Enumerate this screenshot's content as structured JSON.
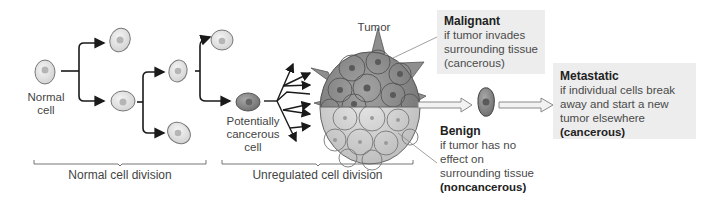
{
  "figure": {
    "labels": {
      "normal_cell": [
        "Normal",
        "cell"
      ],
      "potentially_cancerous": [
        "Potentially",
        "cancerous",
        "cell"
      ],
      "tumor": "Tumor"
    },
    "stages": [
      {
        "label": "Normal cell division"
      },
      {
        "label": "Unregulated cell division"
      }
    ],
    "outcomes": {
      "malignant": {
        "title": "Malignant",
        "lines": [
          "if tumor invades",
          "surrounding tissue",
          "(cancerous)"
        ]
      },
      "benign": {
        "title": "Benign",
        "lines": [
          "if tumor has no",
          "effect on",
          "surrounding tissue"
        ],
        "emphasis": "(noncancerous)"
      },
      "metastatic": {
        "title": "Metastatic",
        "lines": [
          "if individual cells break",
          "away and start a new",
          "tumor elsewhere"
        ],
        "emphasis": "(cancerous)"
      }
    },
    "colors": {
      "box_bg": "#ededed",
      "cell_fill": "#e6e6e6",
      "cancer_cell_fill": "#8f8f8f",
      "tumor_dark": "#8a8a8a",
      "tumor_light": "#d4d4d4",
      "arrow": "#1a1a1a",
      "hollow_arrow": "#9a9a9a"
    }
  }
}
